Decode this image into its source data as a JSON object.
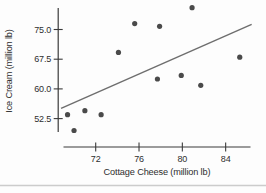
{
  "figure": {
    "background": "#fdfdfd",
    "page_rule_color": "#cccccc"
  },
  "chart_data": {
    "type": "scatter",
    "title": "",
    "xlabel": "Cottage Cheese (million lb)",
    "ylabel": "Ice Cream (million lb)",
    "x_tick_labels": [
      "72",
      "76",
      "80",
      "84"
    ],
    "x_ticks": [
      72,
      76,
      80,
      84
    ],
    "y_tick_labels": [
      "52.5",
      "60.0",
      "67.5",
      "75.0"
    ],
    "y_ticks": [
      52.5,
      60.0,
      67.5,
      75.0
    ],
    "xlim": [
      69.0,
      86.3
    ],
    "ylim": [
      49.0,
      80.5
    ],
    "grid": false,
    "legend": null,
    "points": [
      {
        "x": 69.4,
        "y": 53.5
      },
      {
        "x": 70.0,
        "y": 49.5
      },
      {
        "x": 71.0,
        "y": 54.5
      },
      {
        "x": 72.5,
        "y": 53.5
      },
      {
        "x": 74.1,
        "y": 69.2
      },
      {
        "x": 75.6,
        "y": 76.5
      },
      {
        "x": 77.7,
        "y": 62.5
      },
      {
        "x": 77.9,
        "y": 75.8
      },
      {
        "x": 79.9,
        "y": 63.4
      },
      {
        "x": 80.9,
        "y": 80.5
      },
      {
        "x": 81.7,
        "y": 60.9
      },
      {
        "x": 85.3,
        "y": 68.0
      }
    ],
    "trend_line": {
      "x1": 68.8,
      "y1": 55.1,
      "x2": 86.4,
      "y2": 76.3
    },
    "point_color": "#4a4a4a",
    "trend_line_color": "#6e6e6e",
    "axis_color": "#3a3a3a",
    "text_color": "#2e2e2e"
  }
}
